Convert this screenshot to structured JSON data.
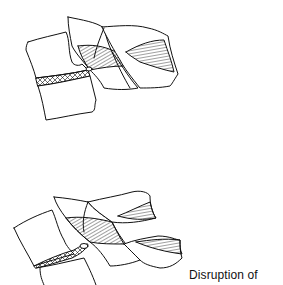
{
  "diagram": {
    "type": "medical line illustration",
    "figures": [
      {
        "id": "top",
        "description": "Intact spinal segment: two vertebral bodies with hatched intervertebral disc and hatched posterior ligament/facet structures"
      },
      {
        "id": "bottom",
        "description": "Disrupted spinal segment: wedged disc and separated posterior elements with hatched ligaments"
      }
    ],
    "caption": "Disruption of",
    "colors": {
      "stroke": "#111111",
      "background": "#ffffff"
    }
  }
}
